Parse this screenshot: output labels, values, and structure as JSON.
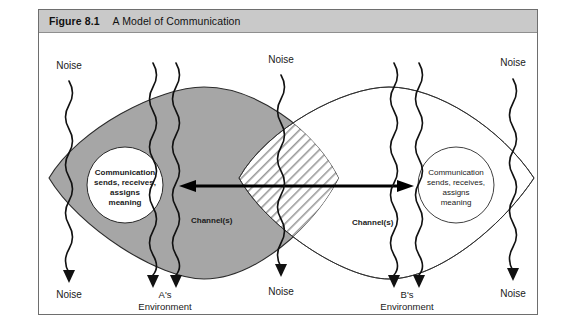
{
  "figure": {
    "number": "Figure 8.1",
    "title": "A Model of Communication"
  },
  "diagram": {
    "type": "communication-model",
    "person_a": {
      "circle_lines": [
        "Communication",
        "sends, receives,",
        "assigns",
        "meaning"
      ],
      "environment_label": [
        "A's",
        "Environment"
      ],
      "channel_label": "Channel(s)",
      "fill_color": "#a6a6a6"
    },
    "person_b": {
      "circle_lines": [
        "Communication",
        "sends, receives,",
        "assigns",
        "meaning"
      ],
      "environment_label": [
        "B's",
        "Environment"
      ],
      "channel_label": "Channel(s)",
      "fill_color": "#ffffff"
    },
    "overlap": {
      "description": "hatched shared-meaning region",
      "pattern": "diagonal-stripes"
    },
    "noise_labels": [
      {
        "id": "noise-top-left",
        "text": "Noise"
      },
      {
        "id": "noise-top-center",
        "text": "Noise"
      },
      {
        "id": "noise-top-right",
        "text": "Noise"
      },
      {
        "id": "noise-bottom-left",
        "text": "Noise"
      },
      {
        "id": "noise-bottom-center",
        "text": "Noise"
      },
      {
        "id": "noise-bottom-right",
        "text": "Noise"
      }
    ],
    "arrow": {
      "label": "",
      "direction": "bidirectional"
    },
    "colors": {
      "frame": "#6e6e6e",
      "title_bar": "#c9c9c9",
      "gray_fill": "#a6a6a6",
      "stroke": "#111111",
      "background": "#ffffff"
    }
  },
  "footnote": {
    "text": ""
  }
}
